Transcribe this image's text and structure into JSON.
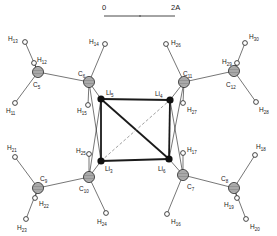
{
  "scale_bar": {
    "start_label": "0",
    "end_label": "2A",
    "x1": 104,
    "x2": 175,
    "y": 16,
    "tick_x": 140
  },
  "colors": {
    "ink": "#1a1a1a",
    "carbon_fill": "#bdbdbd",
    "lithium_fill": "#111111",
    "hydrogen_fill": "#ffffff",
    "background": "#ffffff"
  },
  "atoms": [
    {
      "id": "Li5",
      "el": "Li",
      "sub": "5",
      "type": "lithium",
      "x": 101,
      "y": 99,
      "lx": 106,
      "ly": 95
    },
    {
      "id": "Li4",
      "el": "Li",
      "sub": "4",
      "type": "lithium",
      "x": 170,
      "y": 100,
      "lx": 155,
      "ly": 96
    },
    {
      "id": "Li3",
      "el": "Li",
      "sub": "3",
      "type": "lithium",
      "x": 101,
      "y": 161,
      "lx": 105,
      "ly": 171
    },
    {
      "id": "Li6",
      "el": "Li",
      "sub": "6",
      "type": "lithium",
      "x": 169,
      "y": 159,
      "lx": 158,
      "ly": 171
    },
    {
      "id": "C5",
      "el": "C",
      "sub": "5",
      "type": "carbon",
      "x": 38,
      "y": 72,
      "lx": 33,
      "ly": 87
    },
    {
      "id": "C6",
      "el": "C",
      "sub": "6",
      "type": "carbon",
      "x": 89,
      "y": 82,
      "lx": 78,
      "ly": 76
    },
    {
      "id": "C11",
      "el": "C",
      "sub": "11",
      "type": "carbon",
      "x": 184,
      "y": 82,
      "lx": 183,
      "ly": 76
    },
    {
      "id": "C12",
      "el": "C",
      "sub": "12",
      "type": "carbon",
      "x": 234,
      "y": 71,
      "lx": 226,
      "ly": 87
    },
    {
      "id": "C9",
      "el": "C",
      "sub": "9",
      "type": "carbon",
      "x": 38,
      "y": 188,
      "lx": 40,
      "ly": 181
    },
    {
      "id": "C10",
      "el": "C",
      "sub": "10",
      "type": "carbon",
      "x": 89,
      "y": 177,
      "lx": 79,
      "ly": 191
    },
    {
      "id": "C7",
      "el": "C",
      "sub": "7",
      "type": "carbon",
      "x": 183,
      "y": 175,
      "lx": 187,
      "ly": 189
    },
    {
      "id": "C8",
      "el": "C",
      "sub": "8",
      "type": "carbon",
      "x": 234,
      "y": 188,
      "lx": 221,
      "ly": 181
    },
    {
      "id": "H11",
      "el": "H",
      "sub": "11",
      "type": "hydrogen",
      "x": 15,
      "y": 103,
      "lx": 6,
      "ly": 113
    },
    {
      "id": "H12",
      "el": "H",
      "sub": "12",
      "type": "hydrogen",
      "x": 34,
      "y": 63,
      "lx": 37,
      "ly": 62
    },
    {
      "id": "H13",
      "el": "H",
      "sub": "13",
      "type": "hydrogen",
      "x": 25,
      "y": 42,
      "lx": 8,
      "ly": 41
    },
    {
      "id": "H14",
      "el": "H",
      "sub": "14",
      "type": "hydrogen",
      "x": 105,
      "y": 44,
      "lx": 89,
      "ly": 44
    },
    {
      "id": "H15",
      "el": "H",
      "sub": "15",
      "type": "hydrogen",
      "x": 88,
      "y": 105,
      "lx": 77,
      "ly": 113
    },
    {
      "id": "H16",
      "el": "H",
      "sub": "16",
      "type": "hydrogen",
      "x": 167,
      "y": 214,
      "lx": 171,
      "ly": 224
    },
    {
      "id": "H17",
      "el": "H",
      "sub": "17",
      "type": "hydrogen",
      "x": 183,
      "y": 153,
      "lx": 187,
      "ly": 152
    },
    {
      "id": "H18",
      "el": "H",
      "sub": "18",
      "type": "hydrogen",
      "x": 255,
      "y": 155,
      "lx": 256,
      "ly": 149
    },
    {
      "id": "H19",
      "el": "H",
      "sub": "19",
      "type": "hydrogen",
      "x": 237,
      "y": 198,
      "lx": 224,
      "ly": 207
    },
    {
      "id": "H20",
      "el": "H",
      "sub": "20",
      "type": "hydrogen",
      "x": 246,
      "y": 219,
      "lx": 250,
      "ly": 229
    },
    {
      "id": "H21",
      "el": "H",
      "sub": "21",
      "type": "hydrogen",
      "x": 15,
      "y": 157,
      "lx": 7,
      "ly": 150
    },
    {
      "id": "H22",
      "el": "H",
      "sub": "22",
      "type": "hydrogen",
      "x": 35,
      "y": 198,
      "lx": 39,
      "ly": 206
    },
    {
      "id": "H23",
      "el": "H",
      "sub": "23",
      "type": "hydrogen",
      "x": 26,
      "y": 219,
      "lx": 17,
      "ly": 230
    },
    {
      "id": "H24",
      "el": "H",
      "sub": "24",
      "type": "hydrogen",
      "x": 106,
      "y": 213,
      "lx": 97,
      "ly": 224
    },
    {
      "id": "H25",
      "el": "H",
      "sub": "25",
      "type": "hydrogen",
      "x": 89,
      "y": 154,
      "lx": 76,
      "ly": 153
    },
    {
      "id": "H26",
      "el": "H",
      "sub": "26",
      "type": "hydrogen",
      "x": 166,
      "y": 44,
      "lx": 171,
      "ly": 45
    },
    {
      "id": "H27",
      "el": "H",
      "sub": "27",
      "type": "hydrogen",
      "x": 183,
      "y": 103,
      "lx": 187,
      "ly": 112
    },
    {
      "id": "H28",
      "el": "H",
      "sub": "28",
      "type": "hydrogen",
      "x": 256,
      "y": 102,
      "lx": 259,
      "ly": 112
    },
    {
      "id": "H29",
      "el": "H",
      "sub": "29",
      "type": "hydrogen",
      "x": 237,
      "y": 63,
      "lx": 222,
      "ly": 64
    },
    {
      "id": "H30",
      "el": "H",
      "sub": "30",
      "type": "hydrogen",
      "x": 245,
      "y": 43,
      "lx": 249,
      "ly": 39
    }
  ],
  "bonds": [
    {
      "a": "Li5",
      "b": "Li4",
      "style": "heavy"
    },
    {
      "a": "Li5",
      "b": "Li3",
      "style": "heavy"
    },
    {
      "a": "Li3",
      "b": "Li6",
      "style": "heavy"
    },
    {
      "a": "Li4",
      "b": "Li6",
      "style": "heavy"
    },
    {
      "a": "Li5",
      "b": "Li6",
      "style": "heavy"
    },
    {
      "a": "Li3",
      "b": "Li4",
      "style": "dashed"
    },
    {
      "a": "C5",
      "b": "C6",
      "style": "thin"
    },
    {
      "a": "C5",
      "b": "H11",
      "style": "thin"
    },
    {
      "a": "C5",
      "b": "H12",
      "style": "thin"
    },
    {
      "a": "C5",
      "b": "H13",
      "style": "thin"
    },
    {
      "a": "C6",
      "b": "H14",
      "style": "thin"
    },
    {
      "a": "C6",
      "b": "H15",
      "style": "thin"
    },
    {
      "a": "C6",
      "b": "Li5",
      "style": "thin"
    },
    {
      "a": "C6",
      "b": "Li3",
      "style": "thin"
    },
    {
      "a": "C11",
      "b": "C12",
      "style": "thin"
    },
    {
      "a": "C11",
      "b": "H26",
      "style": "thin"
    },
    {
      "a": "C11",
      "b": "H27",
      "style": "thin"
    },
    {
      "a": "C11",
      "b": "Li4",
      "style": "thin"
    },
    {
      "a": "C11",
      "b": "Li6",
      "style": "thin"
    },
    {
      "a": "C12",
      "b": "H28",
      "style": "thin"
    },
    {
      "a": "C12",
      "b": "H29",
      "style": "thin"
    },
    {
      "a": "C12",
      "b": "H30",
      "style": "thin"
    },
    {
      "a": "C9",
      "b": "C10",
      "style": "thin"
    },
    {
      "a": "C9",
      "b": "H21",
      "style": "thin"
    },
    {
      "a": "C9",
      "b": "H22",
      "style": "thin"
    },
    {
      "a": "C9",
      "b": "H23",
      "style": "thin"
    },
    {
      "a": "C10",
      "b": "H24",
      "style": "thin"
    },
    {
      "a": "C10",
      "b": "H25",
      "style": "thin"
    },
    {
      "a": "C10",
      "b": "Li3",
      "style": "thin"
    },
    {
      "a": "C10",
      "b": "Li5",
      "style": "thin"
    },
    {
      "a": "C7",
      "b": "C8",
      "style": "thin"
    },
    {
      "a": "C7",
      "b": "H16",
      "style": "thin"
    },
    {
      "a": "C7",
      "b": "H17",
      "style": "thin"
    },
    {
      "a": "C7",
      "b": "Li6",
      "style": "thin"
    },
    {
      "a": "C7",
      "b": "Li4",
      "style": "thin"
    },
    {
      "a": "C8",
      "b": "H18",
      "style": "thin"
    },
    {
      "a": "C8",
      "b": "H19",
      "style": "thin"
    },
    {
      "a": "C8",
      "b": "H20",
      "style": "thin"
    }
  ]
}
